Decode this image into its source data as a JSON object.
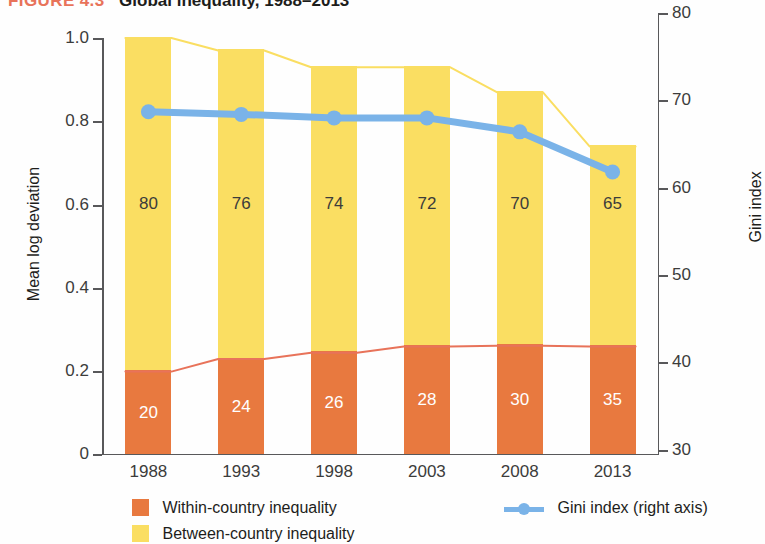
{
  "figure": {
    "number": "FIGURE 4.3",
    "title": "Global inequality, 1988–2013"
  },
  "axes": {
    "left_title": "Mean log deviation",
    "right_title": "Gini index",
    "left_ticks": [
      "1.0",
      "0.8",
      "0.6",
      "0.4",
      "0.2",
      "0"
    ],
    "right_ticks": [
      "80",
      "70",
      "60",
      "50",
      "40",
      "30"
    ]
  },
  "legend": {
    "within_label": "Within-country inequality",
    "between_label": "Between-country inequality",
    "gini_label": "Gini index (right axis)",
    "within_color": "#e8793f",
    "between_color": "#fade62",
    "gini_color": "#7ab3e8"
  },
  "chart_data": {
    "type": "bar",
    "title": "Global inequality, 1988–2013",
    "xlabel": "",
    "ylabel": "Mean log deviation",
    "y2label": "Gini index",
    "ylim": [
      0,
      1.0
    ],
    "y2lim": [
      30,
      80
    ],
    "grid": false,
    "legend_position": "bottom",
    "categories": [
      "1988",
      "1993",
      "1998",
      "2003",
      "2008",
      "2013"
    ],
    "series": [
      {
        "name": "Within-country inequality",
        "type": "bar",
        "stack": "total",
        "axis": "left",
        "color": "#e8793f",
        "values": [
          0.2,
          0.23,
          0.245,
          0.26,
          0.262,
          0.26
        ],
        "labels": [
          "20",
          "24",
          "26",
          "28",
          "30",
          "35"
        ]
      },
      {
        "name": "Between-country inequality",
        "type": "bar",
        "stack": "total",
        "axis": "left",
        "color": "#fade62",
        "values": [
          0.8,
          0.74,
          0.685,
          0.67,
          0.608,
          0.48
        ],
        "labels": [
          "80",
          "76",
          "74",
          "72",
          "70",
          "65"
        ]
      },
      {
        "name": "Gini index (right axis)",
        "type": "line",
        "axis": "right",
        "color": "#7ab3e8",
        "values": [
          68.7,
          68.4,
          68.0,
          68.0,
          66.4,
          61.8
        ]
      }
    ],
    "bar_totals": [
      1.0,
      0.97,
      0.93,
      0.93,
      0.87,
      0.74
    ]
  }
}
